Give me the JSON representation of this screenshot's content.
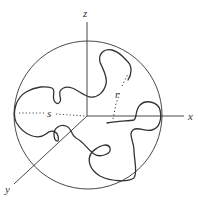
{
  "figure": {
    "type": "3D random coil polymer chain inside a sphere",
    "labels": {
      "z_axis": "z",
      "x_axis": "x",
      "y_axis": "y",
      "s_label": "s",
      "r_label": "r"
    },
    "colors": {
      "line": "#333333",
      "background": "#ffffff"
    }
  }
}
